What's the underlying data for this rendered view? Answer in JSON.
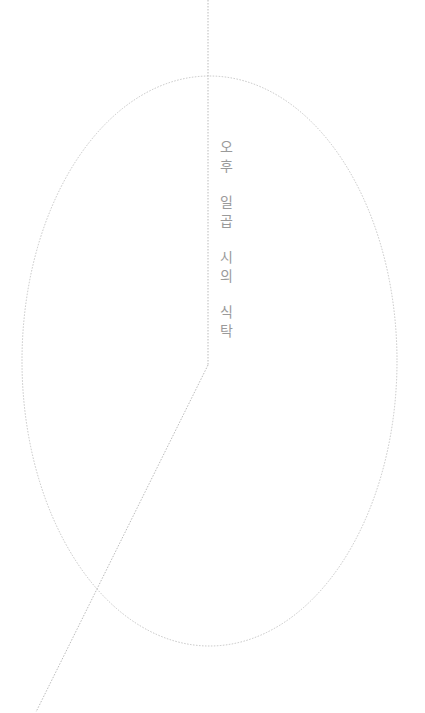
{
  "title": {
    "groups": [
      [
        "오",
        "후"
      ],
      [
        "일",
        "곱"
      ],
      [
        "시",
        "의"
      ],
      [
        "식",
        "탁"
      ]
    ],
    "full_text": "오후 일곱 시의 식탁",
    "color": "#9a9a9a"
  },
  "graphics": {
    "line_color": "#b5b5b5",
    "ellipse": {
      "cx": 209.5,
      "cy": 361,
      "rx": 187.5,
      "ry": 285
    },
    "vertical_line": {
      "x": 208,
      "y1": 0,
      "y2": 365
    },
    "diagonal_line": {
      "x1": 208,
      "y1": 365,
      "x2": 36,
      "y2": 712
    }
  }
}
